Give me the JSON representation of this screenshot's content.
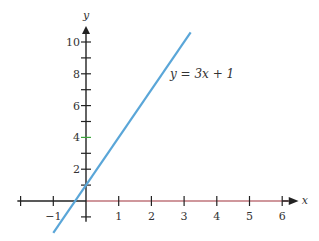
{
  "chart_data": {
    "type": "line",
    "title": "",
    "xlabel": "x",
    "ylabel": "y",
    "xlim": [
      -2,
      6.4
    ],
    "ylim": [
      -2,
      11
    ],
    "grid": false,
    "x_ticks": [
      -2,
      -1,
      0,
      1,
      2,
      3,
      4,
      5,
      6
    ],
    "x_tick_labels": [
      "",
      "−1",
      "",
      "1",
      "2",
      "3",
      "4",
      "5",
      "6"
    ],
    "y_ticks": [
      -1,
      1,
      2,
      3,
      4,
      5,
      6,
      7,
      8,
      9,
      10
    ],
    "y_tick_labels": [
      "",
      "",
      "2",
      "",
      "4",
      "",
      "6",
      "",
      "8",
      "",
      "10"
    ],
    "series": [
      {
        "name": "y = 3x + 1",
        "equation": "y = 3x + 1",
        "x": [
          -1,
          3.2
        ],
        "y": [
          -2,
          10.6
        ],
        "color": "#5aa6d8"
      }
    ],
    "annotations": [
      {
        "text": "y = 3x + 1",
        "x": 3.4,
        "y": 6.4
      }
    ],
    "colors": {
      "axis": "#222222",
      "x_axis_positive": "#a0303a",
      "line": "#5aa6d8",
      "highlight_tick": "#3aa53a"
    }
  }
}
